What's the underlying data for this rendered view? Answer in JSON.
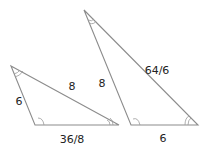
{
  "diagram": {
    "triangles": [
      {
        "id": "left",
        "vertices": [
          [
            11,
            66
          ],
          [
            35,
            125
          ],
          [
            119,
            125
          ]
        ],
        "labels": [
          {
            "text": "6",
            "x": 19,
            "y": 105
          },
          {
            "text": "8",
            "x": 72,
            "y": 90
          },
          {
            "text": "36/8",
            "x": 72,
            "y": 143
          }
        ]
      },
      {
        "id": "right",
        "vertices": [
          [
            84,
            10
          ],
          [
            131,
            125
          ],
          [
            198,
            125
          ]
        ],
        "labels": [
          {
            "text": "8",
            "x": 102,
            "y": 87
          },
          {
            "text": "64/6",
            "x": 157,
            "y": 74
          },
          {
            "text": "6",
            "x": 163,
            "y": 142
          }
        ]
      }
    ],
    "colors": {
      "edge": "#8c8c8c",
      "text": "#222222"
    }
  }
}
